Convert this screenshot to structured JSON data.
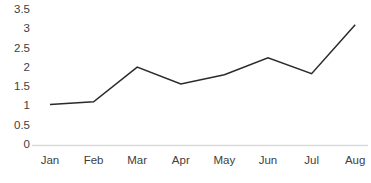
{
  "chart_data": {
    "type": "line",
    "title": "",
    "subtitle": "",
    "xlabel": "",
    "ylabel": "",
    "categories": [
      "Jan",
      "Feb",
      "Mar",
      "Apr",
      "May",
      "Jun",
      "Jul",
      "Aug"
    ],
    "series": [
      {
        "name": "",
        "values": [
          1.05,
          1.12,
          2.02,
          1.58,
          1.82,
          2.26,
          1.85,
          3.12
        ]
      }
    ],
    "ylim": [
      0,
      3.5
    ],
    "y_ticks": [
      0,
      0.5,
      1,
      1.5,
      2,
      2.5,
      3,
      3.5
    ],
    "y_tick_labels": [
      "0",
      "0.5",
      "1",
      "1.5",
      "2",
      "2.5",
      "3",
      "3.5"
    ],
    "grid": false,
    "legend": "none",
    "markers": false,
    "colors": {
      "line": "#2a2a2a",
      "axis": "#d9d9d9",
      "tick_text": "#404040",
      "background": "#ffffff"
    },
    "line_width": 1.5,
    "axis": {
      "x_axis_visible": true,
      "y_axis_visible": false,
      "tick_marks": false
    }
  }
}
